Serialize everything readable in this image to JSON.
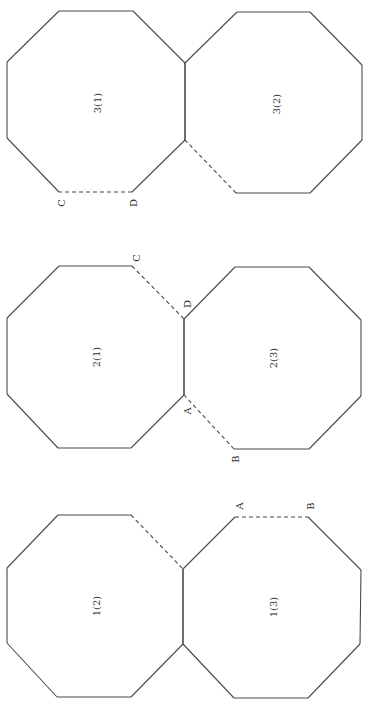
{
  "figure": {
    "orientation": "rotated -90 degrees (reads bottom-to-top)",
    "line_color": "#4a4a4a",
    "text_color": "#333333",
    "groups": [
      {
        "id": "group-3",
        "octagons": [
          {
            "label": "3(1)",
            "label_pos": [
              97,
              103
            ],
            "vertices": [
              [
                59,
                11
              ],
              [
                133,
                11
              ],
              [
                185,
                63
              ],
              [
                185,
                140
              ],
              [
                132,
                192
              ],
              [
                59,
                192
              ],
              [
                7,
                138
              ],
              [
                7,
                62
              ]
            ],
            "dashed_edges": [
              4
            ]
          },
          {
            "label": "3(2)",
            "label_pos": [
              276,
              104
            ],
            "vertices": [
              [
                237,
                12
              ],
              [
                310,
                12
              ],
              [
                362,
                65
              ],
              [
                362,
                140
              ],
              [
                310,
                193
              ],
              [
                236,
                193
              ],
              [
                185,
                140
              ],
              [
                185,
                63
              ]
            ],
            "dashed_edges": [
              5
            ]
          }
        ],
        "points": [
          {
            "label": "C",
            "pos": [
              61,
              203
            ]
          },
          {
            "label": "D",
            "pos": [
              133,
              203
            ]
          }
        ]
      },
      {
        "id": "group-2",
        "octagons": [
          {
            "label": "2(1)",
            "label_pos": [
              96,
              357
            ],
            "vertices": [
              [
                59,
                266
              ],
              [
                132,
                266
              ],
              [
                184,
                319
              ],
              [
                184,
                395
              ],
              [
                131,
                448
              ],
              [
                58,
                448
              ],
              [
                7,
                394
              ],
              [
                7,
                318
              ]
            ],
            "dashed_edges": [
              1
            ]
          },
          {
            "label": "2(3)",
            "label_pos": [
              273,
              358
            ],
            "vertices": [
              [
                235,
                267
              ],
              [
                309,
                267
              ],
              [
                361,
                320
              ],
              [
                361,
                396
              ],
              [
                309,
                449
              ],
              [
                234,
                449
              ],
              [
                184,
                395
              ],
              [
                184,
                319
              ]
            ],
            "dashed_edges": [
              5
            ]
          }
        ],
        "points": [
          {
            "label": "C",
            "pos": [
              136,
              258
            ]
          },
          {
            "label": "D",
            "pos": [
              187,
              304
            ]
          },
          {
            "label": "A",
            "pos": [
              187,
              411
            ]
          },
          {
            "label": "B",
            "pos": [
              235,
              459
            ]
          }
        ]
      },
      {
        "id": "group-1",
        "octagons": [
          {
            "label": "1(2)",
            "label_pos": [
              96,
              606
            ],
            "vertices": [
              [
                58,
                515
              ],
              [
                131,
                515
              ],
              [
                183,
                569
              ],
              [
                183,
                644
              ],
              [
                131,
                697
              ],
              [
                57,
                697
              ],
              [
                7,
                643
              ],
              [
                7,
                568
              ]
            ],
            "dashed_edges": [
              1
            ]
          },
          {
            "label": "1(3)",
            "label_pos": [
              273,
              607
            ],
            "vertices": [
              [
                235,
                517
              ],
              [
                308,
                517
              ],
              [
                361,
                570
              ],
              [
                360,
                644
              ],
              [
                308,
                698
              ],
              [
                234,
                698
              ],
              [
                183,
                644
              ],
              [
                183,
                569
              ]
            ],
            "dashed_edges": [
              0
            ]
          }
        ],
        "points": [
          {
            "label": "A",
            "pos": [
              239,
              506
            ]
          },
          {
            "label": "B",
            "pos": [
              310,
              506
            ]
          }
        ]
      }
    ]
  }
}
